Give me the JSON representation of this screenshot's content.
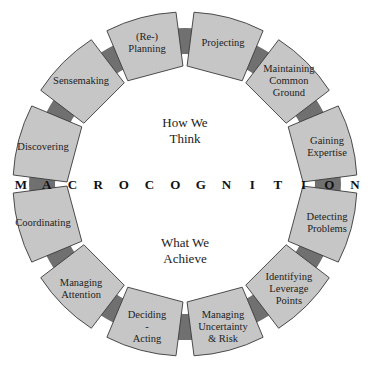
{
  "title_band": {
    "letters": [
      "M",
      "A",
      "C",
      "R",
      "O",
      "C",
      "O",
      "G",
      "N",
      "I",
      "T",
      "I",
      "O",
      "N"
    ],
    "word": "MACROCOGNITION"
  },
  "center": {
    "top_label_line1": "How We",
    "top_label_line2": "Think",
    "bottom_label_line1": "What We",
    "bottom_label_line2": "Achieve"
  },
  "segments": [
    {
      "id": "projecting",
      "lines": [
        "Projecting"
      ]
    },
    {
      "id": "maintaining-common-ground",
      "lines": [
        "Maintaining",
        "Common",
        "Ground"
      ]
    },
    {
      "id": "gaining-expertise",
      "lines": [
        "Gaining",
        "Expertise"
      ]
    },
    {
      "id": "detecting-problems",
      "lines": [
        "Detecting",
        "Problems"
      ]
    },
    {
      "id": "identifying-leverage-points",
      "lines": [
        "Identifying",
        "Leverage",
        "Points"
      ]
    },
    {
      "id": "managing-uncertainty-risk",
      "lines": [
        "Managing",
        "Uncertainty",
        "& Risk"
      ]
    },
    {
      "id": "deciding-acting",
      "lines": [
        "Deciding",
        "-",
        "Acting"
      ]
    },
    {
      "id": "managing-attention",
      "lines": [
        "Managing",
        "Attention"
      ]
    },
    {
      "id": "coordinating",
      "lines": [
        "Coordinating"
      ]
    },
    {
      "id": "discovering",
      "lines": [
        "Discovering"
      ]
    },
    {
      "id": "sensemaking",
      "lines": [
        "Sensemaking"
      ]
    },
    {
      "id": "re-planning",
      "lines": [
        "(Re-)",
        "Planning"
      ]
    }
  ],
  "colors": {
    "segment_fill": "#c6c6c6",
    "segment_stroke": "#3a3a3a",
    "connector_fill": "#707070",
    "background": "#ffffff"
  }
}
